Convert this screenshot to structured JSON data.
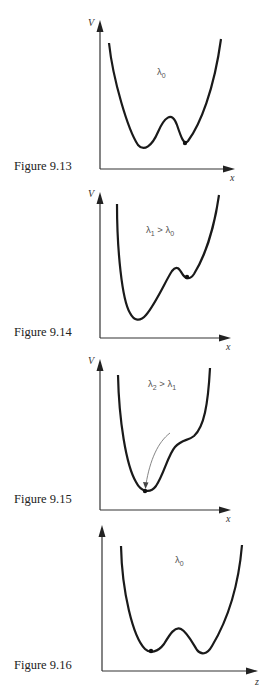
{
  "figures": [
    {
      "caption": "Figure 9.13",
      "y_axis_label": "V",
      "x_axis_label": "x",
      "parameter_label": "λ0",
      "parameter_html": {
        "base": "λ",
        "sub": "0",
        "rest": ""
      },
      "description": "Asymmetric double-well potential; ball resting in right (shallower) well"
    },
    {
      "caption": "Figure 9.14",
      "y_axis_label": "V",
      "x_axis_label": "x",
      "parameter_label": "λ1 > λ0",
      "parameter_html": {
        "base": "λ",
        "sub": "1",
        "rest": " > λ",
        "sub2": "0"
      },
      "description": "Right well becomes metastable; ball in shallow right well"
    },
    {
      "caption": "Figure 9.15",
      "y_axis_label": "V",
      "x_axis_label": "x",
      "parameter_label": "λ2 > λ1",
      "parameter_html": {
        "base": "λ",
        "sub": "2",
        "rest": " > λ",
        "sub2": "1"
      },
      "description": "Right well disappears into a shoulder; arrow shows ball rolling into left minimum"
    },
    {
      "caption": "Figure 9.16",
      "y_axis_label": "",
      "x_axis_label": "z",
      "parameter_label": "λ0",
      "parameter_html": {
        "base": "λ",
        "sub": "0",
        "rest": ""
      },
      "description": "Symmetric double-well potential; ball in left well"
    }
  ],
  "colors": {
    "curve": "#1a1a1a",
    "axis": "#333333",
    "arrow": "#555555",
    "text": "#222222"
  }
}
